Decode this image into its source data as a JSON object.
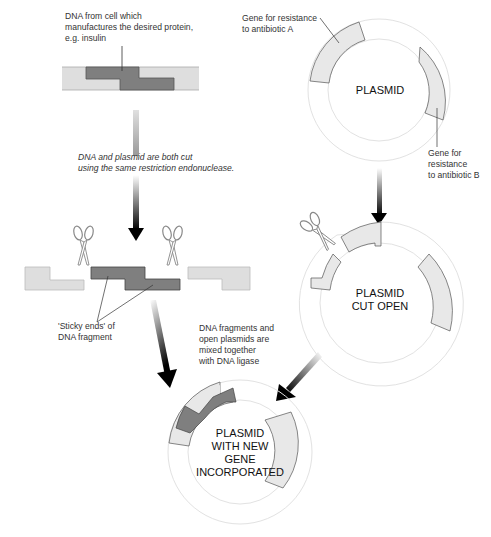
{
  "labels": {
    "dna_source": "DNA from cell which\nmanufactures the desired protein,\ne.g. insulin",
    "gene_a": "Gene for resistance\nto antibiotic A",
    "gene_b": "Gene for\nresistance\nto antibiotic B",
    "cut_step": "DNA and plasmid are both cut\nusing the same restriction endonuclease.",
    "sticky_ends": "'Sticky ends' of\nDNA fragment",
    "ligase_step": "DNA fragments and\nopen plasmids are\nmixed together\nwith DNA ligase"
  },
  "plasmids": {
    "original": "PLASMID",
    "cut_open": "PLASMID\nCUT OPEN",
    "recombinant": "PLASMID\nWITH NEW\nGENE\nINCORPORATED"
  },
  "colors": {
    "light_gray": "#e6e6e6",
    "dark_gray": "#7f7f7f",
    "ring_line": "#dddddd",
    "outline": "#555555",
    "arrow": "#000000"
  },
  "icons": [
    "scissors-icon-left",
    "scissors-icon-middle",
    "scissors-icon-plasmid"
  ]
}
